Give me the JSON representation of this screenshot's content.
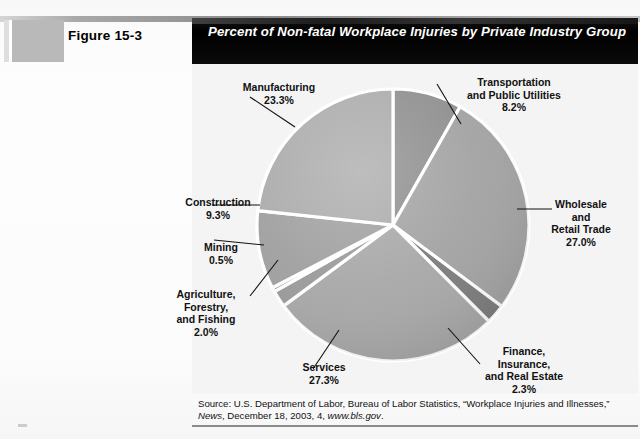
{
  "figure": {
    "label": "Figure 15-3",
    "title": "Percent of Non-fatal Workplace Injuries by Private Industry Group"
  },
  "source": {
    "prefix": "Source: U.S. Department of Labor, Bureau of Labor Statistics, “Workplace Injuries and Illnesses,” ",
    "publication": "News",
    "middle": ", December 18, 2003, 4, ",
    "url": "www.bls.gov",
    "suffix": "."
  },
  "labels": {
    "manufacturing": "Manufacturing\n23.3%",
    "transportation": "Transportation\nand Public Utilities\n8.2%",
    "wholesale": "Wholesale\nand\nRetail Trade\n27.0%",
    "construction": "Construction\n9.3%",
    "mining": "Mining\n0.5%",
    "agriculture": "Agriculture,\nForestry,\nand Fishing\n2.0%",
    "services": "Services\n27.3%",
    "finance": "Finance,\nInsurance,\nand Real Estate\n2.3%"
  },
  "chart_data": {
    "type": "pie",
    "title": "Percent of Non-fatal Workplace Injuries by Private Industry Group",
    "units": "percent",
    "legend": "none (direct callout labels with leader lines)",
    "start_angle_deg": -90,
    "direction": "clockwise",
    "categories": [
      "Transportation and Public Utilities",
      "Wholesale and Retail Trade",
      "Finance, Insurance, and Real Estate",
      "Services",
      "Agriculture, Forestry, and Fishing",
      "Mining",
      "Construction",
      "Manufacturing"
    ],
    "values": [
      8.2,
      27.0,
      2.3,
      27.3,
      2.0,
      0.5,
      9.3,
      23.3
    ],
    "slice_colors": [
      "#8f8f8f",
      "#a3a3a3",
      "#7d7d7d",
      "#a8a8a8",
      "#9b9b9b",
      "#8a8a8a",
      "#a0a0a0",
      "#ababab"
    ],
    "total": 99.9,
    "xlabel": "",
    "ylabel": ""
  },
  "colors": {
    "title_bar": "#000000",
    "title_text": "#ffffff",
    "panel_bg": "#f4f4f4",
    "swatch": "#b9b9b9",
    "slice_divider": "#ffffff",
    "rule": "#8a8a8a"
  }
}
